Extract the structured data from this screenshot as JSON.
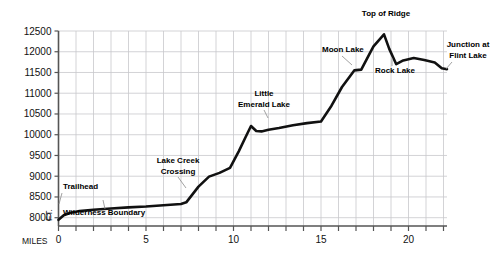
{
  "chart_data": {
    "type": "line",
    "title": "",
    "xlabel": "MILES",
    "ylabel": "FT.",
    "xlim": [
      0,
      22.2
    ],
    "ylim": [
      7800,
      12500
    ],
    "grid": true,
    "legend": "none",
    "x_tick_step": 1,
    "x_labeled_ticks": [
      {
        "value": 0,
        "label": "0"
      },
      {
        "value": 5,
        "label": "5"
      },
      {
        "value": 10,
        "label": "10"
      },
      {
        "value": 15,
        "label": "15"
      },
      {
        "value": 20,
        "label": "20"
      }
    ],
    "y_ticks": [
      {
        "value": 8000,
        "label": "8000"
      },
      {
        "value": 8500,
        "label": "8500"
      },
      {
        "value": 9000,
        "label": "9000"
      },
      {
        "value": 9500,
        "label": "9500"
      },
      {
        "value": 10000,
        "label": "10000"
      },
      {
        "value": 10500,
        "label": "10500"
      },
      {
        "value": 11000,
        "label": "11000"
      },
      {
        "value": 11500,
        "label": "11500"
      },
      {
        "value": 12000,
        "label": "12000"
      },
      {
        "value": 12500,
        "label": "12500"
      }
    ],
    "series": [
      {
        "name": "Trail elevation profile",
        "x": [
          0,
          0.3,
          0.7,
          1.2,
          2.0,
          3.0,
          4.0,
          5.0,
          6.0,
          7.0,
          7.3,
          8.0,
          8.6,
          9.2,
          9.8,
          10.3,
          10.7,
          11.0,
          11.3,
          11.6,
          12.0,
          12.6,
          13.4,
          14.2,
          15.0,
          15.6,
          16.2,
          16.9,
          17.3,
          17.9,
          18.0,
          18.6,
          18.9,
          19.3,
          19.7,
          20.3,
          20.9,
          21.5,
          21.9,
          22.2
        ],
        "y": [
          7950,
          8060,
          8120,
          8160,
          8190,
          8220,
          8250,
          8270,
          8300,
          8330,
          8370,
          8750,
          8990,
          9080,
          9200,
          9600,
          9950,
          10210,
          10090,
          10080,
          10120,
          10160,
          10230,
          10280,
          10320,
          10700,
          11150,
          11550,
          11570,
          12050,
          12130,
          12420,
          12070,
          11700,
          11790,
          11850,
          11800,
          11740,
          11600,
          11580
        ]
      }
    ],
    "annotations": [
      {
        "label": "Trailhead",
        "x_mile": 0.35,
        "elevation": 8030
      },
      {
        "label": "Wilderness Boundary",
        "x_mile": 2.55,
        "elevation": 8200
      },
      {
        "label": "Lake Creek\nCrossing",
        "x_mile": 7.3,
        "elevation": 8360
      },
      {
        "label": "Little\nEmerald Lake",
        "x_mile": 11.0,
        "elevation": 10210
      },
      {
        "label": "Moon Lake",
        "x_mile": 17.1,
        "elevation": 11570
      },
      {
        "label": "Top of Ridge",
        "x_mile": 18.6,
        "elevation": 12420
      },
      {
        "label": "Rock Lake",
        "x_mile": 19.3,
        "elevation": 11700
      },
      {
        "label": "Junction at\nFlint Lake",
        "x_mile": 22.2,
        "elevation": 11580
      }
    ]
  },
  "colors": {
    "line": "#111111",
    "grid": "#c8c8cc",
    "axis": "#555555",
    "text": "#111111",
    "background": "#ffffff"
  },
  "labels": {
    "trailhead": "Trailhead",
    "wilderness_boundary": "Wilderness Boundary",
    "lake_creek_crossing_line1": "Lake Creek",
    "lake_creek_crossing_line2": "Crossing",
    "little_emerald_lake_line1": "Little",
    "little_emerald_lake_line2": "Emerald Lake",
    "moon_lake": "Moon Lake",
    "top_of_ridge": "Top of Ridge",
    "rock_lake": "Rock Lake",
    "junction_flint_lake_line1": "Junction at",
    "junction_flint_lake_line2": "Flint Lake",
    "miles_axis": "MILES",
    "ft_axis": "FT."
  }
}
